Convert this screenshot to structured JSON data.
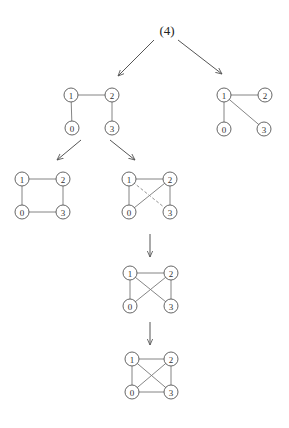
{
  "root": {
    "label": "(4)",
    "x": 167,
    "y": 30
  },
  "node_radius": 7,
  "graphs": [
    {
      "id": "A",
      "nodes": [
        {
          "label": "1",
          "x": 71,
          "y": 95
        },
        {
          "label": "2",
          "x": 112,
          "y": 95
        },
        {
          "label": "0",
          "x": 72,
          "y": 128
        },
        {
          "label": "3",
          "x": 112,
          "y": 128
        }
      ],
      "edges": [
        {
          "from": 0,
          "to": 1,
          "style": "solid"
        },
        {
          "from": 0,
          "to": 2,
          "style": "solid"
        },
        {
          "from": 1,
          "to": 3,
          "style": "solid"
        }
      ]
    },
    {
      "id": "B",
      "nodes": [
        {
          "label": "1",
          "x": 224,
          "y": 95
        },
        {
          "label": "2",
          "x": 265,
          "y": 95
        },
        {
          "label": "0",
          "x": 224,
          "y": 129
        },
        {
          "label": "3",
          "x": 264,
          "y": 129
        }
      ],
      "edges": [
        {
          "from": 0,
          "to": 1,
          "style": "solid"
        },
        {
          "from": 0,
          "to": 2,
          "style": "solid"
        },
        {
          "from": 0,
          "to": 3,
          "style": "solid"
        }
      ]
    },
    {
      "id": "C",
      "nodes": [
        {
          "label": "1",
          "x": 22,
          "y": 179
        },
        {
          "label": "2",
          "x": 63,
          "y": 179
        },
        {
          "label": "0",
          "x": 22,
          "y": 212
        },
        {
          "label": "3",
          "x": 63,
          "y": 212
        }
      ],
      "edges": [
        {
          "from": 0,
          "to": 1,
          "style": "solid"
        },
        {
          "from": 0,
          "to": 2,
          "style": "solid"
        },
        {
          "from": 1,
          "to": 3,
          "style": "solid"
        },
        {
          "from": 2,
          "to": 3,
          "style": "solid"
        }
      ]
    },
    {
      "id": "D",
      "nodes": [
        {
          "label": "1",
          "x": 129,
          "y": 179
        },
        {
          "label": "2",
          "x": 170,
          "y": 179
        },
        {
          "label": "0",
          "x": 129,
          "y": 212
        },
        {
          "label": "3",
          "x": 170,
          "y": 212
        }
      ],
      "edges": [
        {
          "from": 0,
          "to": 1,
          "style": "solid"
        },
        {
          "from": 0,
          "to": 2,
          "style": "solid"
        },
        {
          "from": 1,
          "to": 3,
          "style": "solid"
        },
        {
          "from": 1,
          "to": 2,
          "style": "solid"
        },
        {
          "from": 0,
          "to": 3,
          "style": "dashed"
        }
      ]
    },
    {
      "id": "E",
      "nodes": [
        {
          "label": "1",
          "x": 130,
          "y": 273
        },
        {
          "label": "2",
          "x": 171,
          "y": 273
        },
        {
          "label": "0",
          "x": 130,
          "y": 306
        },
        {
          "label": "3",
          "x": 171,
          "y": 306
        }
      ],
      "edges": [
        {
          "from": 0,
          "to": 1,
          "style": "solid"
        },
        {
          "from": 0,
          "to": 2,
          "style": "solid"
        },
        {
          "from": 1,
          "to": 3,
          "style": "solid"
        },
        {
          "from": 1,
          "to": 2,
          "style": "solid"
        },
        {
          "from": 0,
          "to": 3,
          "style": "solid"
        }
      ]
    },
    {
      "id": "F",
      "nodes": [
        {
          "label": "1",
          "x": 132,
          "y": 359
        },
        {
          "label": "2",
          "x": 171,
          "y": 359
        },
        {
          "label": "0",
          "x": 132,
          "y": 392
        },
        {
          "label": "3",
          "x": 171,
          "y": 392
        }
      ],
      "edges": [
        {
          "from": 0,
          "to": 1,
          "style": "solid"
        },
        {
          "from": 0,
          "to": 2,
          "style": "solid"
        },
        {
          "from": 1,
          "to": 3,
          "style": "solid"
        },
        {
          "from": 1,
          "to": 2,
          "style": "solid"
        },
        {
          "from": 0,
          "to": 3,
          "style": "solid"
        },
        {
          "from": 2,
          "to": 3,
          "style": "solid"
        }
      ]
    }
  ],
  "arrows": [
    {
      "x1": 154,
      "y1": 40,
      "x2": 118,
      "y2": 76
    },
    {
      "x1": 178,
      "y1": 40,
      "x2": 222,
      "y2": 74
    },
    {
      "x1": 81,
      "y1": 140,
      "x2": 57,
      "y2": 160
    },
    {
      "x1": 110,
      "y1": 140,
      "x2": 135,
      "y2": 160
    },
    {
      "x1": 150,
      "y1": 234,
      "x2": 150,
      "y2": 257
    },
    {
      "x1": 150,
      "y1": 322,
      "x2": 150,
      "y2": 345
    }
  ]
}
